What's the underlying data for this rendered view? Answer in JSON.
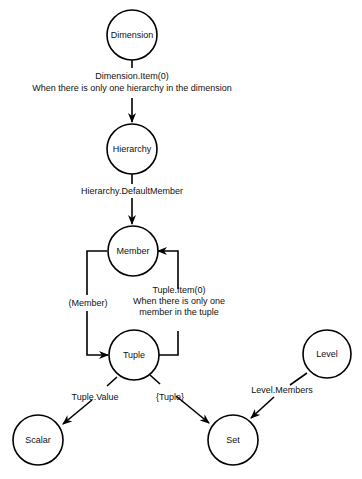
{
  "nodes": {
    "dimension": "Dimension",
    "hierarchy": "Hierarchy",
    "member": "Member",
    "tuple": "Tuple",
    "level": "Level",
    "scalar": "Scalar",
    "set": "Set"
  },
  "edges": {
    "dimension_to_hierarchy": {
      "line1": "Dimension.Item(0)",
      "line2": "When there is only one hierarchy in the dimension"
    },
    "hierarchy_to_member": {
      "line1": "Hierarchy.DefaultMember"
    },
    "member_to_tuple": {
      "line1": "(Member)"
    },
    "tuple_to_member": {
      "line1": "Tuple.Item(0)",
      "line2": "When there is only one",
      "line3": "member in the tuple"
    },
    "tuple_to_scalar": {
      "line1": "Tuple.Value"
    },
    "tuple_to_set": {
      "line1": "{Tuple}"
    },
    "level_to_set": {
      "line1": "Level.Members"
    }
  }
}
